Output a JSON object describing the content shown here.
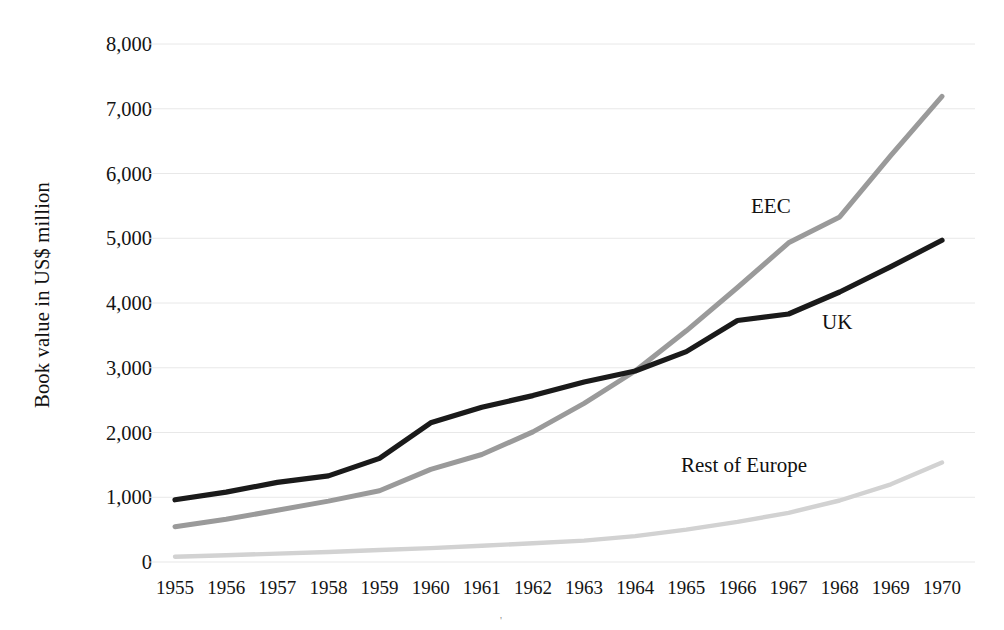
{
  "chart_data": {
    "type": "line",
    "title": "",
    "xlabel": "",
    "ylabel": "Book value in US$ million",
    "categories": [
      "1955",
      "1956",
      "1957",
      "1958",
      "1959",
      "1960",
      "1961",
      "1962",
      "1963",
      "1964",
      "1965",
      "1966",
      "1967",
      "1968",
      "1969",
      "1970"
    ],
    "x": [
      1955,
      1956,
      1957,
      1958,
      1959,
      1960,
      1961,
      1962,
      1963,
      1964,
      1965,
      1966,
      1967,
      1968,
      1969,
      1970
    ],
    "ylim": [
      0,
      8000
    ],
    "xlim": [
      1955,
      1970
    ],
    "y_ticks": [
      "0",
      "1,000",
      "2,000",
      "3,000",
      "4,000",
      "5,000",
      "6,000",
      "7,000",
      "8,000"
    ],
    "y_tick_values": [
      0,
      1000,
      2000,
      3000,
      4000,
      5000,
      6000,
      7000,
      8000
    ],
    "grid": "horizontal",
    "legend": "inline-annotations",
    "series": [
      {
        "name": "UK",
        "color": "#1a1a1a",
        "values": [
          960,
          1080,
          1230,
          1330,
          1600,
          2150,
          2390,
          2570,
          2780,
          2950,
          3250,
          3730,
          3830,
          4170,
          4560,
          4970
        ]
      },
      {
        "name": "EEC",
        "color": "#9a9a9a",
        "values": [
          545,
          660,
          800,
          940,
          1100,
          1430,
          1660,
          2010,
          2450,
          2950,
          3570,
          4240,
          4930,
          5330,
          6280,
          7190
        ]
      },
      {
        "name": "Rest of Europe",
        "color": "#d2d2d2",
        "values": [
          80,
          105,
          130,
          155,
          185,
          215,
          250,
          290,
          330,
          400,
          500,
          620,
          760,
          950,
          1200,
          1535
        ]
      }
    ],
    "annotations": [
      {
        "text": "EEC",
        "series": "EEC"
      },
      {
        "text": "UK",
        "series": "UK"
      },
      {
        "text": "Rest of Europe",
        "series": "Rest of Europe"
      }
    ],
    "gridline_color": "#e8e8e8",
    "background": "#ffffff"
  },
  "stray_mark": "'"
}
